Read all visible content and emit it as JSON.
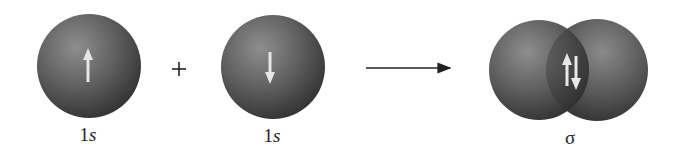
{
  "diagram": {
    "left_orbital": {
      "label_num": "1",
      "label_sub": "s",
      "spin": "up"
    },
    "operator": "+",
    "right_orbital": {
      "label_num": "1",
      "label_sub": "s",
      "spin": "down"
    },
    "reaction_arrow": "→",
    "product": {
      "label": "σ",
      "spins": [
        "up",
        "down"
      ]
    },
    "colors": {
      "sphere_light": "#8a8a8a",
      "sphere_dark": "#3a3a3a",
      "spin_arrow": "#e8e8e8",
      "text": "#222222"
    }
  }
}
